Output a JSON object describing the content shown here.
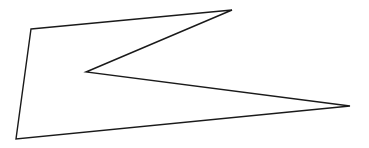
{
  "canvas": {
    "width": 369,
    "height": 148,
    "background": "#ffffff"
  },
  "shape": {
    "type": "polygon",
    "points": [
      [
        31,
        29
      ],
      [
        232,
        10
      ],
      [
        86,
        72
      ],
      [
        350,
        106
      ],
      [
        16,
        139
      ]
    ],
    "stroke": "#1a1a1a",
    "stroke_width": 1.4,
    "fill": "none"
  }
}
